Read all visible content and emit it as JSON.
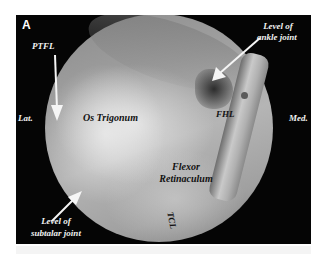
{
  "figure": {
    "panel_label": "A",
    "orientation": {
      "left": "Lat.",
      "right": "Med."
    },
    "labels": {
      "ptfl": "PTFL",
      "ankle_joint_line1": "Level of",
      "ankle_joint_line2": "ankle joint",
      "fhl": "FHL",
      "os_trigonum": "Os Trigonum",
      "flexor_line1": "Flexor",
      "flexor_line2": "Retinaculum",
      "tcl": "TCL",
      "subtalar_line1": "Level of",
      "subtalar_line2": "subtalar joint"
    },
    "colors": {
      "background": "#050505",
      "label_on_dark": "#f2f2f2",
      "label_on_tissue": "#111111"
    }
  }
}
